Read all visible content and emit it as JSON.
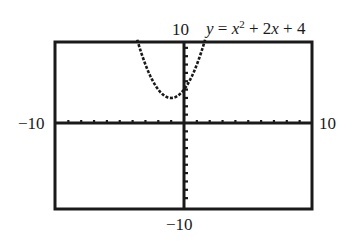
{
  "chart_data": {
    "type": "line",
    "function": "x^2 + 2x + 4",
    "xlabel": "",
    "ylabel": "",
    "xlim": [
      -10,
      10
    ],
    "ylim": [
      -10,
      10
    ],
    "xscale": 1,
    "yscale": 1,
    "grid": false,
    "axis_labels": {
      "xmin": "-10",
      "xmax": "10",
      "ymin": "-10",
      "ymax": "10"
    },
    "vertex": [
      -1,
      3
    ],
    "x": [
      -3.6,
      -3,
      -2.5,
      -2,
      -1.5,
      -1,
      -0.5,
      0,
      0.5,
      1,
      1.5,
      1.6
    ],
    "values": [
      9.76,
      7,
      5.25,
      4,
      3.25,
      3,
      3.25,
      4,
      5.25,
      7,
      9.25,
      9.76
    ],
    "style": "dotted-pixel (graphing calculator)"
  },
  "labels": {
    "ymax": "10",
    "xmin": "−10",
    "xmax": "10",
    "ymin": "−10"
  },
  "equation": {
    "lhs": "y",
    "eq": " = ",
    "x1": "x",
    "exp": "2",
    "rest": " + 2",
    "x2": "x",
    "tail": " + 4"
  },
  "colors": {
    "ink": "#1a1a1a",
    "background": "#ffffff"
  }
}
